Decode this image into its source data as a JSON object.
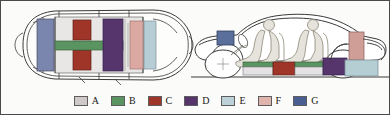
{
  "figure": {
    "title": "",
    "views": [
      {
        "name": "top-view",
        "label": ""
      },
      {
        "name": "side-view",
        "label": ""
      }
    ]
  },
  "legend": {
    "items": [
      {
        "key": "A",
        "label": "A",
        "color": "#cfc9c9",
        "icon": "swatch-a"
      },
      {
        "key": "B",
        "label": "B",
        "color": "#5a9460",
        "icon": "swatch-b"
      },
      {
        "key": "C",
        "label": "C",
        "color": "#9e3528",
        "icon": "swatch-c"
      },
      {
        "key": "D",
        "label": "D",
        "color": "#55356b",
        "icon": "swatch-d"
      },
      {
        "key": "E",
        "label": "E",
        "color": "#bcd2d8",
        "icon": "swatch-e"
      },
      {
        "key": "F",
        "label": "F",
        "color": "#e0b3ac",
        "icon": "swatch-f"
      },
      {
        "key": "G",
        "label": "G",
        "color": "#4a5f91",
        "icon": "swatch-g"
      }
    ]
  },
  "topview": {
    "body_outline_color": "#3a3a3a",
    "body_fill": "#fdfdfc",
    "cabin_fill": "#e8e7e5",
    "components": [
      {
        "name": "rear-pack-g",
        "legend_key": "G",
        "color": "#7a86ad"
      },
      {
        "name": "floor-tray-a",
        "legend_key": "A",
        "color": "#dedbd8"
      },
      {
        "name": "module-c-rear",
        "legend_key": "C",
        "color": "#9e3528"
      },
      {
        "name": "module-c-front",
        "legend_key": "C",
        "color": "#9e3528"
      },
      {
        "name": "cross-beam-b",
        "legend_key": "B",
        "color": "#5a9460"
      },
      {
        "name": "module-d",
        "legend_key": "D",
        "color": "#55356b"
      },
      {
        "name": "module-f",
        "legend_key": "F",
        "color": "#dba9a2"
      },
      {
        "name": "module-e",
        "legend_key": "E",
        "color": "#b7cdd6"
      }
    ]
  },
  "sideview": {
    "outline_color": "#3a3a3a",
    "ground_line_color": "#3a3a3a",
    "occupants": [
      {
        "name": "driver-figure",
        "fill": "#e6e3dc"
      },
      {
        "name": "passenger-figure",
        "fill": "#e6e3dc"
      }
    ],
    "wheels": [
      {
        "name": "front-wheel"
      },
      {
        "name": "rear-wheel"
      }
    ],
    "components": [
      {
        "name": "front-module-g",
        "legend_key": "G",
        "color": "#5b6f9c"
      },
      {
        "name": "underfloor-b-1",
        "legend_key": "B",
        "color": "#5a9460"
      },
      {
        "name": "underfloor-a-1",
        "legend_key": "A",
        "color": "#e4e1e4"
      },
      {
        "name": "underfloor-c",
        "legend_key": "C",
        "color": "#9e3528"
      },
      {
        "name": "underfloor-b-2",
        "legend_key": "B",
        "color": "#5a9460"
      },
      {
        "name": "underfloor-a-2",
        "legend_key": "A",
        "color": "#e4e1e4"
      },
      {
        "name": "underfloor-d",
        "legend_key": "D",
        "color": "#55356b"
      },
      {
        "name": "rear-module-f",
        "legend_key": "F",
        "color": "#cf9e97"
      },
      {
        "name": "rear-module-e",
        "legend_key": "E",
        "color": "#b4ced4"
      }
    ]
  }
}
